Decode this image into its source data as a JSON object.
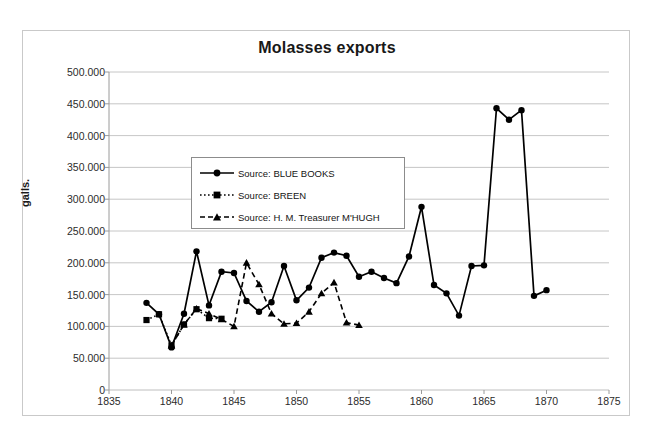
{
  "chart_data": {
    "type": "line",
    "title": "Molasses exports",
    "xlabel": "",
    "ylabel": "galls.",
    "xlim": [
      1835,
      1875
    ],
    "ylim": [
      0,
      500000
    ],
    "xticks": [
      1835,
      1840,
      1845,
      1850,
      1855,
      1860,
      1865,
      1870,
      1875
    ],
    "xtick_labels": [
      "1835",
      "1840",
      "1845",
      "1850",
      "1855",
      "1860",
      "1865",
      "1870",
      "1875"
    ],
    "yticks": [
      0,
      50000,
      100000,
      150000,
      200000,
      250000,
      300000,
      350000,
      400000,
      450000,
      500000
    ],
    "ytick_labels": [
      "0",
      "50.000",
      "100.000",
      "150.000",
      "200.000",
      "250.000",
      "300.000",
      "350.000",
      "400.000",
      "450.000",
      "500.000"
    ],
    "grid": "horizontal",
    "legend_position": "upper-left-inside",
    "series": [
      {
        "name": "Source: BLUE BOOKS",
        "marker": "circle",
        "linestyle": "solid",
        "color": "#000000",
        "x": [
          1838,
          1839,
          1840,
          1841,
          1842,
          1843,
          1844,
          1845,
          1846,
          1847,
          1848,
          1849,
          1850,
          1851,
          1852,
          1853,
          1854,
          1855,
          1856,
          1857,
          1858,
          1859,
          1860,
          1861,
          1862,
          1863,
          1864,
          1865,
          1866,
          1867,
          1868,
          1869,
          1870
        ],
        "y": [
          137000,
          119000,
          67000,
          120000,
          218000,
          133000,
          186000,
          184000,
          140000,
          123000,
          138000,
          195000,
          141000,
          161000,
          208000,
          216000,
          211000,
          178000,
          186000,
          176000,
          168000,
          210000,
          288000,
          165000,
          152000,
          117000,
          195000,
          196000,
          443000,
          425000,
          440000,
          148000,
          157000
        ]
      },
      {
        "name": "Source: BREEN",
        "marker": "square",
        "linestyle": "dotted",
        "color": "#000000",
        "x": [
          1838,
          1839,
          1840,
          1841,
          1842,
          1843,
          1844
        ],
        "y": [
          110000,
          119000,
          70000,
          103000,
          127000,
          113000,
          112000
        ]
      },
      {
        "name": "Source: H. M. Treasurer M'HUGH",
        "marker": "triangle",
        "linestyle": "dashed",
        "color": "#000000",
        "x": [
          1840,
          1841,
          1842,
          1843,
          1844,
          1845,
          1846,
          1847,
          1848,
          1849,
          1850,
          1851,
          1852,
          1853,
          1854,
          1855
        ],
        "y": [
          70000,
          103000,
          128000,
          120000,
          111000,
          100000,
          200000,
          166000,
          120000,
          104000,
          105000,
          123000,
          152000,
          169000,
          106000,
          102000
        ]
      }
    ]
  },
  "legend": {
    "items": [
      {
        "label": "Source: BLUE BOOKS"
      },
      {
        "label": "Source: BREEN"
      },
      {
        "label": "Source: H. M. Treasurer M'HUGH"
      }
    ]
  }
}
